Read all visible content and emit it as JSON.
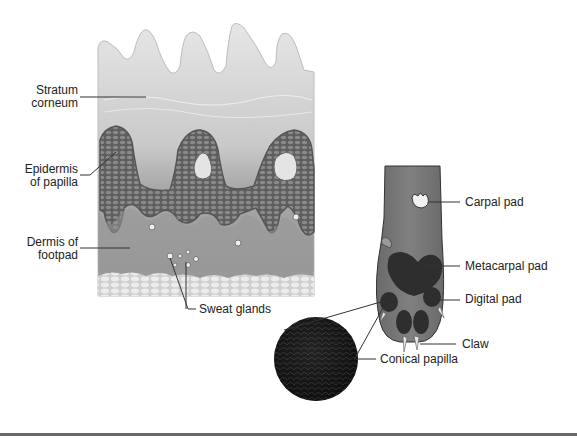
{
  "figure": {
    "left_panel": {
      "title": "Footpad skin cross-section",
      "labels": {
        "stratum_corneum": [
          "Stratum",
          "corneum"
        ],
        "epidermis_of_papilla": [
          "Epidermis",
          "of papilla"
        ],
        "dermis_of_footpad": [
          "Dermis of",
          "footpad"
        ],
        "sweat_glands": "Sweat glands"
      }
    },
    "right_panel": {
      "title": "Paw (palmar view)",
      "labels": {
        "carpal_pad": "Carpal pad",
        "metacarpal_pad": "Metacarpal pad",
        "digital_pad": "Digital pad",
        "claw": "Claw",
        "conical_papilla": "Conical papilla"
      }
    },
    "colors": {
      "stratum": "#d9d9d9",
      "epidermis_cells": "#6e6e6e",
      "dermis": "#9a9a9a",
      "subcutis": "#e2e2e2",
      "paw": "#7a7a7a",
      "pads": "#2e2e2e",
      "label_line": "#333333",
      "bottom_rule": "#6a6a6a"
    }
  }
}
